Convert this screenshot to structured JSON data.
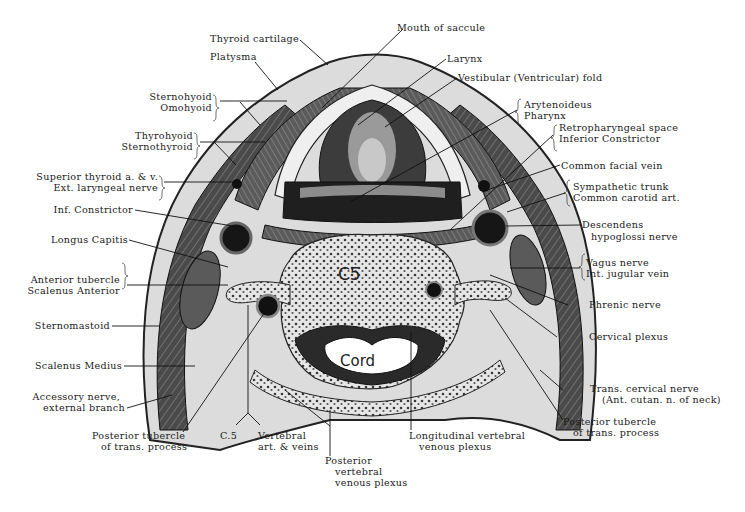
{
  "figure": {
    "colors": {
      "ink": "#1a1a1a",
      "tissue_dark": "#2b2b2b",
      "tissue_mid": "#6e6e6e",
      "tissue_light": "#c9c9c9",
      "background": "#ffffff"
    },
    "vertebra_label": "C5",
    "cord_label": "Cord"
  },
  "labels": {
    "thyroid_cartilage": "Thyroid cartilage",
    "platysma": "Platysma",
    "sternohyoid": "Sternohyoid",
    "omohyoid": "Omohyoid",
    "thyrohyoid": "Thyrohyoid",
    "sternothyroid": "Sternothyroid",
    "superior_thyroid": "Superior thyroid a. & v.",
    "ext_laryngeal": "Ext. laryngeal nerve",
    "inf_constrictor": "Inf. Constrictor",
    "longus_capitis": "Longus Capitis",
    "anterior_tubercle": "Anterior tubercle",
    "scalenus_anterior": "Scalenus Anterior",
    "sternomastoid": "Sternomastoid",
    "scalenus_medius": "Scalenus Medius",
    "accessory_1": "Accessory nerve,",
    "accessory_2": "external branch",
    "post_tubercle_left_1": "Posterior tubercle",
    "post_tubercle_left_2": "of trans. process",
    "c5": "C.5",
    "vertebral_1": "Vertebral",
    "vertebral_2": "art. & veins",
    "posterior_plexus_1": "Posterior",
    "posterior_plexus_2": "vertebral",
    "posterior_plexus_3": "venous plexus",
    "longitudinal_1": "Longitudinal vertebral",
    "longitudinal_2": "venous plexus",
    "post_tubercle_right_1": "Posterior tubercle",
    "post_tubercle_right_2": "of trans. process",
    "trans_cervical_1": "Trans. cervical nerve",
    "trans_cervical_2": "(Ant. cutan. n. of neck)",
    "cervical_plexus": "Cervical plexus",
    "phrenic": "Phrenic nerve",
    "vagus": "Vagus nerve",
    "int_jugular": "Int. jugular vein",
    "descendens_1": "Descendens",
    "descendens_2": "hypoglossi nerve",
    "sympathetic": "Sympathetic trunk",
    "common_carotid": "Common carotid art.",
    "common_facial": "Common facial vein",
    "retropharyngeal": "Retropharyngeal space",
    "inferior_constrictor": "Inferior Constrictor",
    "arytenoideus": "Arytenoideus",
    "pharynx": "Pharynx",
    "vestibular": "Vestibular (Ventricular) fold",
    "larynx": "Larynx",
    "mouth_saccule": "Mouth of saccule"
  }
}
